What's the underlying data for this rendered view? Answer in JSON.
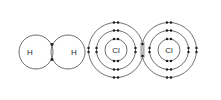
{
  "figure": {
    "background_color": "#ffffff",
    "shell_color": "#4a4a4a",
    "electron_color": "#1c1c1c",
    "label_color": "#2b2b2b",
    "overlap_color": "#bdbdbd"
  },
  "molecules": [
    {
      "name": "hydrogen-molecule",
      "formula": "H2",
      "atoms": [
        {
          "label": "H",
          "element": "hydrogen",
          "center_x": 36,
          "center_y": 52,
          "shells": [
            {
              "radius": 17,
              "electrons": 1
            }
          ]
        },
        {
          "label": "H",
          "element": "hydrogen",
          "center_x": 68,
          "center_y": 52,
          "shells": [
            {
              "radius": 17,
              "electrons": 1
            }
          ]
        }
      ],
      "shared_electrons": 2,
      "bond_x": 52,
      "bond_y": 52
    },
    {
      "name": "chlorine-molecule",
      "formula": "Cl2",
      "atoms": [
        {
          "label": "Cl",
          "element": "chlorine",
          "center_x": 116,
          "center_y": 50,
          "shells": [
            {
              "radius": 11,
              "electrons": 2
            },
            {
              "radius": 19.5,
              "electrons": 8
            },
            {
              "radius": 27.5,
              "electrons": 7
            }
          ]
        },
        {
          "label": "Cl",
          "element": "chlorine",
          "center_x": 169,
          "center_y": 50,
          "shells": [
            {
              "radius": 11,
              "electrons": 2
            },
            {
              "radius": 19.5,
              "electrons": 8
            },
            {
              "radius": 27.5,
              "electrons": 7
            }
          ]
        }
      ],
      "shared_electrons": 2,
      "bond_x": 142.5,
      "bond_y": 50
    }
  ],
  "labels": {
    "hydrogen": "H",
    "chlorine": "Cl"
  }
}
